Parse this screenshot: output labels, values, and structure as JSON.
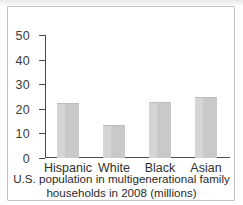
{
  "chart_data": {
    "type": "bar",
    "title": "",
    "caption_line1": "U.S. population in multigenerational family",
    "caption_line2": "households in 2008 (millions)",
    "xlabel": "",
    "ylabel": "",
    "ylim": [
      0,
      50
    ],
    "ytick_labels": [
      "0",
      "10",
      "20",
      "30",
      "40",
      "50"
    ],
    "ytick_values": [
      0,
      10,
      20,
      30,
      40,
      50
    ],
    "grid": false,
    "legend": "none",
    "categories": [
      "Hispanic",
      "White",
      "Black",
      "Asian"
    ],
    "values": [
      22,
      13,
      22.5,
      24.5
    ],
    "bar_color": "#c9c9c9",
    "axis_color": "#4a4a4a"
  },
  "figure": {
    "frame_color": "#c2c2c2",
    "background": "#ffffff"
  }
}
